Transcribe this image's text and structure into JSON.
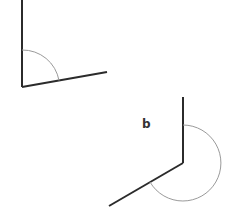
{
  "diagram": {
    "title": "",
    "angles": [
      {
        "id": "a",
        "label": "",
        "kind": "obtuse",
        "measure_deg_approx": 100
      },
      {
        "id": "b",
        "label": "b",
        "kind": "reflex",
        "measure_deg_approx": 240
      }
    ],
    "colors": {
      "ray": "#2b2b2b",
      "arc": "#9a9a9a",
      "label": "#333333",
      "background": "#ffffff"
    }
  }
}
